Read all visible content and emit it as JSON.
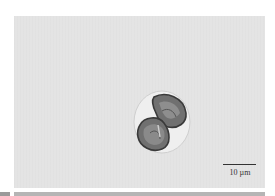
{
  "image": {
    "subject": "microscopy-cell",
    "background_color": "#e4e4e4",
    "scale_bar": {
      "label": "10 µm"
    }
  },
  "colors": {
    "cell_dark": "#6a6a6a",
    "cell_outline": "#3a3a3a",
    "cell_halo": "#efefef"
  }
}
